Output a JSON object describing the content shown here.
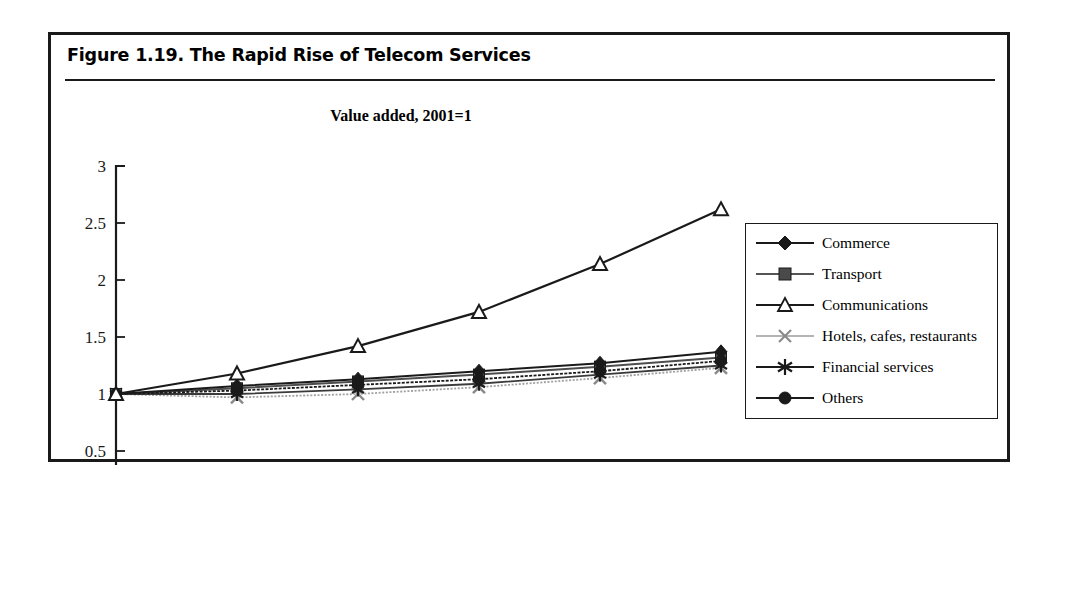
{
  "figure": {
    "title": "Figure 1.19.  The Rapid Rise of Telecom Services",
    "subtitle": "Value added, 2001=1"
  },
  "chart_data": {
    "type": "line",
    "title": "Value added, 2001=1",
    "xlabel": "",
    "ylabel": "",
    "x": [
      "2001",
      "2002",
      "2003",
      "2004",
      "2005",
      "2006"
    ],
    "categories": [
      "2001",
      "2002",
      "2003",
      "2004",
      "2005",
      "2006"
    ],
    "xticks": [
      "2001",
      "2002",
      "2003",
      "2004",
      "2005",
      "2006"
    ],
    "yticks": [
      "0",
      "0.5",
      "1",
      "1.5",
      "2",
      "2.5",
      "3"
    ],
    "ylim": [
      0,
      3
    ],
    "grid": false,
    "legend_position": "right",
    "series": [
      {
        "name": "Commerce",
        "marker": "diamond",
        "values": [
          1,
          1.07,
          1.13,
          1.2,
          1.27,
          1.37
        ]
      },
      {
        "name": "Transport",
        "marker": "square",
        "values": [
          1,
          1.05,
          1.11,
          1.17,
          1.24,
          1.32
        ]
      },
      {
        "name": "Communications",
        "marker": "triangle",
        "values": [
          1,
          1.18,
          1.42,
          1.72,
          2.14,
          2.62
        ]
      },
      {
        "name": "Hotels, cafes, restaurants",
        "marker": "cross",
        "values": [
          1,
          0.97,
          1.0,
          1.06,
          1.14,
          1.23
        ]
      },
      {
        "name": "Financial services",
        "marker": "asterisk",
        "values": [
          1,
          1.0,
          1.04,
          1.09,
          1.17,
          1.25
        ]
      },
      {
        "name": "Others",
        "marker": "circle",
        "values": [
          1,
          1.03,
          1.08,
          1.13,
          1.2,
          1.29
        ]
      }
    ]
  },
  "legend": {
    "items": [
      {
        "label": "Commerce",
        "marker": "diamond-marker"
      },
      {
        "label": "Transport",
        "marker": "square-marker"
      },
      {
        "label": "Communications",
        "marker": "triangle-marker"
      },
      {
        "label": "Hotels, cafes, restaurants",
        "marker": "cross-marker"
      },
      {
        "label": "Financial services",
        "marker": "asterisk-marker"
      },
      {
        "label": "Others",
        "marker": "circle-marker"
      }
    ]
  },
  "colors": {
    "ink": "#1a1a1a",
    "light_ink": "#6f6f6f",
    "background": "#ffffff"
  }
}
